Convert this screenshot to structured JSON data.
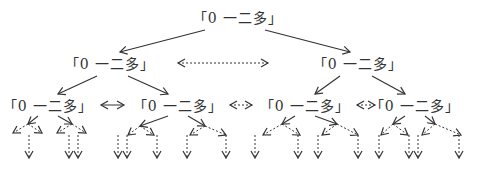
{
  "diagram": {
    "type": "tree",
    "node_label": "「0 一二多」",
    "colors": {
      "stroke": "#333333",
      "text": "#333333",
      "background": "#ffffff"
    },
    "nodes": [
      {
        "id": "root",
        "label": "「0 一二多」",
        "level": 1,
        "x": 238,
        "y": 17
      },
      {
        "id": "l2-left",
        "label": "「0 一二多」",
        "level": 2,
        "x": 110,
        "y": 63
      },
      {
        "id": "l2-right",
        "label": "「0 一二多」",
        "level": 2,
        "x": 358,
        "y": 63
      },
      {
        "id": "l3-1",
        "label": "「0 一二多」",
        "level": 3,
        "x": 48,
        "y": 105
      },
      {
        "id": "l3-2",
        "label": "「0 一二多」",
        "level": 3,
        "x": 178,
        "y": 105
      },
      {
        "id": "l3-3",
        "label": "「0 一二多」",
        "level": 3,
        "x": 305,
        "y": 105
      },
      {
        "id": "l3-4",
        "label": "「0 一二多」",
        "level": 3,
        "x": 415,
        "y": 105
      }
    ],
    "edges": {
      "solid_tree": [
        "root->l2-left",
        "root->l2-right",
        "l2-left->l3-1",
        "l2-left->l3-2",
        "l2-right->l3-3",
        "l2-right->l3-4"
      ],
      "horizontal_links": [
        {
          "between": [
            "l2-left",
            "l2-right"
          ],
          "style": "dashed",
          "bidirectional": true
        },
        {
          "between": [
            "l3-1",
            "l3-2"
          ],
          "style": "solid",
          "bidirectional": true
        },
        {
          "between": [
            "l3-2",
            "l3-3"
          ],
          "style": "dashed",
          "bidirectional": true
        },
        {
          "between": [
            "l3-3",
            "l3-4"
          ],
          "style": "dashed",
          "bidirectional": true
        }
      ],
      "continuation": "dashed arrows branching downward below level 3 (each level-3 node has two solid short branches, each splitting into two dashed branches ending in downward dashed arrows)"
    }
  }
}
